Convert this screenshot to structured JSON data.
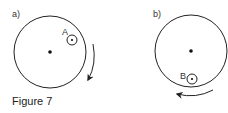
{
  "figure": {
    "caption": "Figure 7",
    "panels": [
      {
        "label": "a)",
        "point_label": "A",
        "rotation": "clockwise",
        "point_position": "upper-right, near rim"
      },
      {
        "label": "b)",
        "point_label": "B",
        "rotation": "counterclockwise",
        "point_position": "bottom, near rim"
      }
    ]
  },
  "colors": {
    "stroke": "#222222",
    "text": "#333333"
  }
}
